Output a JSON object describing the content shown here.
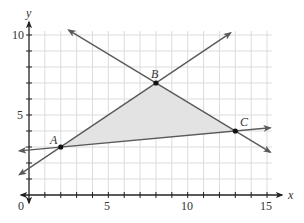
{
  "chart_data": {
    "type": "line",
    "title": "",
    "xlabel": "x",
    "ylabel": "y",
    "xlim": [
      0,
      15
    ],
    "ylim": [
      0,
      10
    ],
    "grid": true,
    "x_ticks": [
      0,
      1,
      2,
      3,
      4,
      5,
      6,
      7,
      8,
      9,
      10,
      11,
      12,
      13,
      14,
      15
    ],
    "y_ticks": [
      0,
      1,
      2,
      3,
      4,
      5,
      6,
      7,
      8,
      9,
      10
    ],
    "x_tick_labels": [
      "0",
      "5",
      "10",
      "15"
    ],
    "y_tick_labels": [
      "5",
      "10"
    ],
    "origin_label": "0",
    "points": [
      {
        "label": "A",
        "x": 2,
        "y": 3
      },
      {
        "label": "B",
        "x": 8,
        "y": 7
      },
      {
        "label": "C",
        "x": 13,
        "y": 4
      }
    ],
    "series": [
      {
        "name": "line AB",
        "slope": 0.6667,
        "intercept": 1.6667,
        "x": [
          -0.6,
          12.7
        ],
        "y": [
          1.27,
          10.13
        ]
      },
      {
        "name": "line BC",
        "slope": -0.6,
        "intercept": 11.8,
        "x": [
          2.5,
          15.2
        ],
        "y": [
          10.3,
          2.68
        ]
      },
      {
        "name": "line AC",
        "slope": 0.0909,
        "intercept": 2.818,
        "x": [
          -0.6,
          15.2
        ],
        "y": [
          2.76,
          4.2
        ]
      }
    ],
    "shaded_region": {
      "vertices": [
        "A",
        "B",
        "C"
      ],
      "fill": "#e6e6e6"
    },
    "colors": {
      "line": "#5a5a5a",
      "grid": "#dcdcdc",
      "axis": "#333333",
      "point": "#111111",
      "fill": "#e3e3e3"
    }
  },
  "labels": {
    "x_axis": "x",
    "y_axis": "y",
    "origin": "0",
    "x5": "5",
    "x10": "10",
    "x15": "15",
    "y5": "5",
    "y10": "10",
    "A": "A",
    "B": "B",
    "C": "C"
  }
}
